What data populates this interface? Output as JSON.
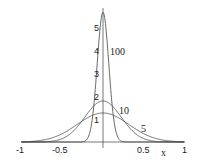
{
  "chart_data": {
    "type": "line",
    "title": "",
    "xlabel": "x",
    "ylabel": "",
    "xlim": [
      -1,
      1
    ],
    "ylim": [
      0,
      5.8
    ],
    "grid": false,
    "legend": "inline curve labels",
    "x_ticks": [
      "-1",
      "-0.5",
      "0.5",
      "1"
    ],
    "y_ticks": [
      "1",
      "2",
      "3",
      "4",
      "5"
    ],
    "formula": "sqrt(n/pi)*exp(-n*x^2)",
    "series": [
      {
        "name": "100",
        "n": 100,
        "peak": 5.64
      },
      {
        "name": "10",
        "n": 10,
        "peak": 1.78
      },
      {
        "name": "5",
        "n": 5,
        "peak": 1.26
      }
    ]
  }
}
